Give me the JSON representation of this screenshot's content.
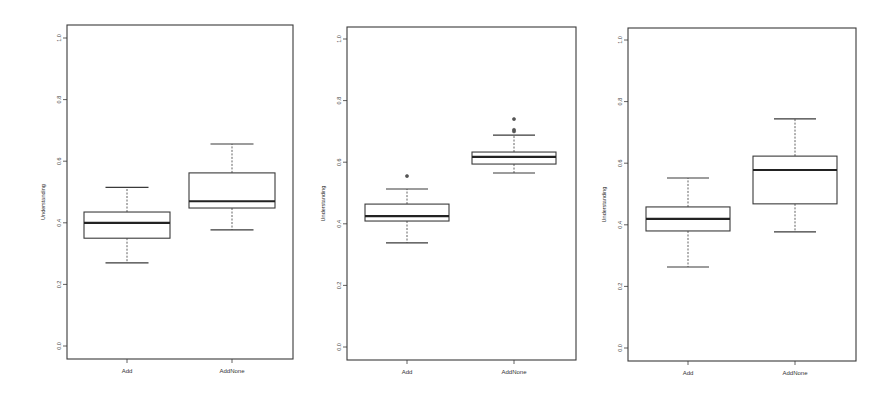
{
  "chart_data": [
    {
      "type": "boxplot",
      "title": "",
      "xlabel": "",
      "ylabel": "Understanding",
      "ylim": [
        0.0,
        1.0
      ],
      "yticks": [
        "0.0",
        "0.2",
        "0.4",
        "0.6",
        "0.8",
        "1.0"
      ],
      "grid": false,
      "legend": null,
      "categories": [
        "Add",
        "AddNone"
      ],
      "boxes": [
        {
          "category": "Add",
          "whisker_low": 0.27,
          "q1": 0.35,
          "median": 0.4,
          "q3": 0.435,
          "whisker_high": 0.515,
          "outliers": []
        },
        {
          "category": "AddNone",
          "whisker_low": 0.377,
          "q1": 0.448,
          "median": 0.47,
          "q3": 0.562,
          "whisker_high": 0.656,
          "outliers": []
        }
      ],
      "frame": {
        "left": 67,
        "top": 25,
        "right": 293,
        "bottom": 359,
        "y0_px": 346,
        "y1_px": 38,
        "x_positions": [
          127,
          232
        ]
      }
    },
    {
      "type": "boxplot",
      "title": "",
      "xlabel": "",
      "ylabel": "Understanding",
      "ylim": [
        0.0,
        1.0
      ],
      "yticks": [
        "0.0",
        "0.2",
        "0.4",
        "0.6",
        "0.8",
        "1.0"
      ],
      "grid": false,
      "legend": null,
      "categories": [
        "Add",
        "AddNone"
      ],
      "boxes": [
        {
          "category": "Add",
          "whisker_low": 0.338,
          "q1": 0.409,
          "median": 0.425,
          "q3": 0.464,
          "whisker_high": 0.513,
          "outliers": [
            0.555
          ]
        },
        {
          "category": "AddNone",
          "whisker_low": 0.565,
          "q1": 0.594,
          "median": 0.617,
          "q3": 0.633,
          "whisker_high": 0.688,
          "outliers": [
            0.7,
            0.705,
            0.74
          ]
        }
      ],
      "frame": {
        "left": 347,
        "top": 27,
        "right": 576,
        "bottom": 360,
        "y0_px": 347,
        "y1_px": 39,
        "x_positions": [
          407,
          514
        ]
      }
    },
    {
      "type": "boxplot",
      "title": "",
      "xlabel": "",
      "ylabel": "Understanding",
      "ylim": [
        0.0,
        1.0
      ],
      "yticks": [
        "0.0",
        "0.2",
        "0.4",
        "0.6",
        "0.8",
        "1.0"
      ],
      "grid": false,
      "legend": null,
      "categories": [
        "Add",
        "AddNone"
      ],
      "boxes": [
        {
          "category": "Add",
          "whisker_low": 0.263,
          "q1": 0.38,
          "median": 0.419,
          "q3": 0.458,
          "whisker_high": 0.552,
          "outliers": []
        },
        {
          "category": "AddNone",
          "whisker_low": 0.377,
          "q1": 0.468,
          "median": 0.578,
          "q3": 0.623,
          "whisker_high": 0.744,
          "outliers": []
        }
      ],
      "frame": {
        "left": 628,
        "top": 28,
        "right": 856,
        "bottom": 361,
        "y0_px": 348,
        "y1_px": 40,
        "x_positions": [
          688,
          795
        ]
      }
    }
  ],
  "style": {
    "line_color": "#3a3a3a",
    "median_color": "#222222",
    "outlier_color": "#555555",
    "background": "#ffffff"
  }
}
